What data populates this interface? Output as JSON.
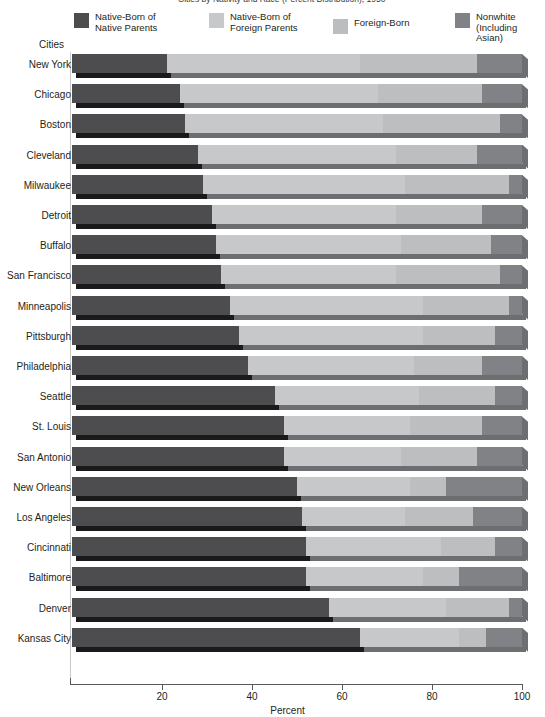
{
  "title": "Cities by Nativity and Race (Percent Distribution), 1950",
  "axis": {
    "y_title": "Cities",
    "x_title": "Percent",
    "x_ticks": [
      20,
      40,
      60,
      80,
      100
    ],
    "x_min": 0,
    "x_max": 100
  },
  "legend": {
    "items": [
      {
        "label": "Native-Born of\nNative Parents",
        "color": "#4d4d4f",
        "name": "native-born-native-parents"
      },
      {
        "label": "Native-Born of\nForeign Parents",
        "color": "#c7c8ca",
        "name": "native-born-foreign-parents"
      },
      {
        "label": "Foreign-Born",
        "color": "#bbbdbf",
        "name": "foreign-born"
      },
      {
        "label": "Nonwhite\n(Including Asian)",
        "color": "#808285",
        "name": "nonwhite-including-asian"
      }
    ]
  },
  "colors": {
    "native_native": "#4d4d4f",
    "native_foreign": "#c7c8ca",
    "foreign_born": "#bcbec0",
    "nonwhite": "#808285",
    "shadow_dark": "#1a1a1a",
    "shadow_light": "#6d6e71",
    "axis": "#58595b",
    "text": "#231f20"
  },
  "chart_data": {
    "type": "bar",
    "orientation": "horizontal",
    "stacked": true,
    "title": "Cities by Nativity and Race (Percent Distribution), 1950",
    "xlabel": "Percent",
    "ylabel": "Cities",
    "xlim": [
      0,
      100
    ],
    "grid": false,
    "legend_position": "top",
    "categories": [
      "New York",
      "Chicago",
      "Boston",
      "Cleveland",
      "Milwaukee",
      "Detroit",
      "Buffalo",
      "San Francisco",
      "Minneapolis",
      "Pittsburgh",
      "Philadelphia",
      "Seattle",
      "St. Louis",
      "San Antonio",
      "New Orleans",
      "Los Angeles",
      "Cincinnati",
      "Baltimore",
      "Denver",
      "Kansas City"
    ],
    "series": [
      {
        "name": "Native-Born of Native Parents",
        "color": "#4d4d4f",
        "values": [
          21,
          24,
          25,
          28,
          29,
          31,
          32,
          33,
          35,
          37,
          39,
          45,
          47,
          47,
          50,
          51,
          52,
          52,
          57,
          64
        ]
      },
      {
        "name": "Native-Born of Foreign Parents",
        "color": "#c7c8ca",
        "values": [
          43,
          44,
          44,
          44,
          45,
          41,
          41,
          39,
          43,
          41,
          37,
          32,
          28,
          26,
          25,
          23,
          30,
          26,
          26,
          22
        ]
      },
      {
        "name": "Foreign-Born",
        "color": "#bcbec0",
        "values": [
          26,
          23,
          26,
          18,
          23,
          19,
          20,
          23,
          19,
          16,
          15,
          17,
          16,
          17,
          8,
          15,
          12,
          8,
          14,
          6
        ]
      },
      {
        "name": "Nonwhite (Including Asian)",
        "color": "#808285",
        "values": [
          10,
          9,
          5,
          10,
          3,
          9,
          7,
          5,
          3,
          6,
          9,
          6,
          9,
          10,
          17,
          11,
          6,
          14,
          3,
          8
        ]
      }
    ]
  }
}
